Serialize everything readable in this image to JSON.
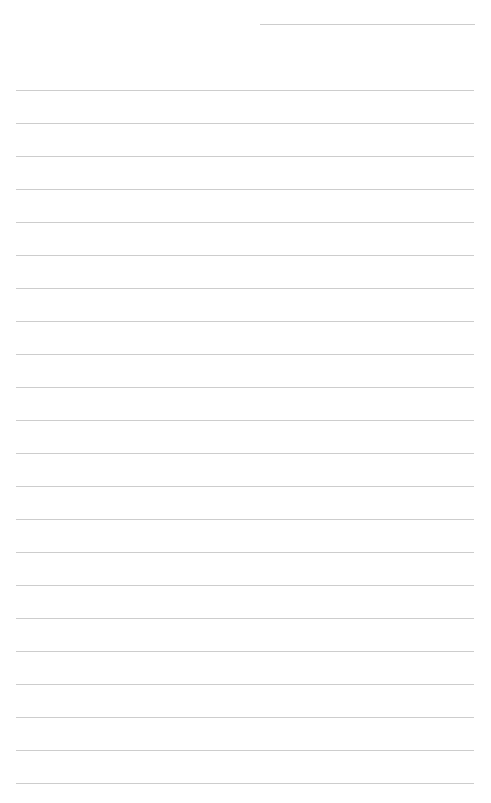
{
  "page": {
    "type": "lined-paper",
    "background": "#ffffff",
    "line_color": "#cdcdcd",
    "header_line": {
      "left": 260,
      "top": 24,
      "width": 215
    },
    "rules": {
      "count": 22,
      "first_top": 90,
      "spacing": 33,
      "left": 16,
      "width": 458
    }
  }
}
